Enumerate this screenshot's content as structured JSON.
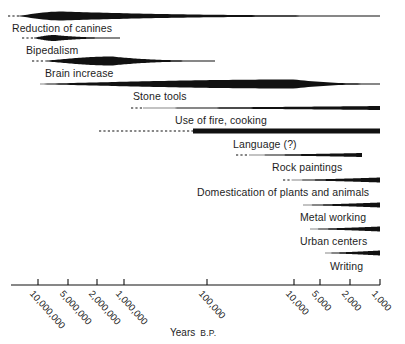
{
  "figure": {
    "axis_title_main": "Years",
    "axis_title_suffix": "B.P.",
    "ink": "#111111"
  },
  "chart_data": {
    "type": "timeline",
    "title": "",
    "xlabel": "Years B.P.",
    "ylabel": "",
    "scale": "logarithmic-reversed",
    "grid": false,
    "legend": null,
    "axis": {
      "line_x_start": 11,
      "line_x_end": 380,
      "line_y": 285,
      "tick_labels": [
        "10,000,000",
        "5,000,000",
        "2,000,000",
        "1,000,000",
        "100,000",
        "10,000",
        "5,000",
        "2,000",
        "1,000"
      ],
      "tick_values": [
        10000000,
        5000000,
        2000000,
        1000000,
        100000,
        10000,
        5000,
        2000,
        1000
      ],
      "tick_x": [
        38,
        68,
        97,
        124,
        207,
        294,
        320,
        350,
        380
      ]
    },
    "categories": [
      "Reduction of canines",
      "Bipedalism",
      "Brain increase",
      "Stone tools",
      "Use of fire, cooking",
      "Language (?)",
      "Rock paintings",
      "Domestication of plants and animals",
      "Metal working",
      "Urban centers",
      "Writing"
    ],
    "bars": [
      {
        "label": "Reduction of canines",
        "shape": "spindle-then-line",
        "dashed_from_x": 8,
        "dashed_to_x": 19,
        "solid_from_x": 19,
        "peak_x": 62,
        "peak_thickness": 9,
        "end_x": 380,
        "end_thickness": 1,
        "y": 16,
        "label_x": 12,
        "label_y": 22
      },
      {
        "label": "Bipedalism",
        "shape": "spindle",
        "dashed_from_x": 22,
        "dashed_to_x": 34,
        "solid_from_x": 34,
        "peak_x": 55,
        "peak_thickness": 6,
        "end_x": 120,
        "end_thickness": 0.8,
        "y": 38,
        "label_x": 26,
        "label_y": 44
      },
      {
        "label": "Brain increase",
        "shape": "spindle",
        "dashed_from_x": 32,
        "dashed_to_x": 45,
        "solid_from_x": 45,
        "peak_x": 112,
        "peak_thickness": 9,
        "end_x": 215,
        "end_thickness": 0.8,
        "y": 61,
        "label_x": 45,
        "label_y": 67
      },
      {
        "label": "Stone tools",
        "shape": "spindle",
        "dashed_from_x": null,
        "dashed_to_x": null,
        "solid_from_x": 40,
        "peak_x": 295,
        "peak_thickness": 9,
        "end_x": 380,
        "end_thickness": 1,
        "y": 84,
        "label_x": 133,
        "label_y": 90
      },
      {
        "label": "Use of fire, cooking",
        "shape": "wedge",
        "dashed_from_x": 131,
        "dashed_to_x": 143,
        "solid_from_x": 143,
        "peak_x": 380,
        "peak_thickness": 4,
        "end_x": 380,
        "end_thickness": 4,
        "y": 108,
        "label_x": 175,
        "label_y": 114
      },
      {
        "label": "Language (?)",
        "shape": "bar",
        "dashed_from_x": 99,
        "dashed_to_x": 193,
        "solid_from_x": 193,
        "peak_x": 380,
        "peak_thickness": 5,
        "end_x": 380,
        "end_thickness": 5,
        "y": 131,
        "label_x": 233,
        "label_y": 138
      },
      {
        "label": "Rock paintings",
        "shape": "wedge",
        "dashed_from_x": 236,
        "dashed_to_x": 249,
        "solid_from_x": 249,
        "peak_x": 362,
        "peak_thickness": 4,
        "end_x": 362,
        "end_thickness": 4,
        "y": 155,
        "label_x": 272,
        "label_y": 161
      },
      {
        "label": "Domestication of plants and animals",
        "shape": "wedge",
        "dashed_from_x": 283,
        "dashed_to_x": 292,
        "solid_from_x": 292,
        "peak_x": 380,
        "peak_thickness": 5,
        "end_x": 380,
        "end_thickness": 5,
        "y": 180,
        "label_x": 197,
        "label_y": 186
      },
      {
        "label": "Metal working",
        "shape": "wedge",
        "dashed_from_x": null,
        "dashed_to_x": null,
        "solid_from_x": 303,
        "peak_x": 380,
        "peak_thickness": 5,
        "end_x": 380,
        "end_thickness": 5,
        "y": 205,
        "label_x": 300,
        "label_y": 211
      },
      {
        "label": "Urban centers",
        "shape": "wedge",
        "dashed_from_x": null,
        "dashed_to_x": null,
        "solid_from_x": 310,
        "peak_x": 380,
        "peak_thickness": 5,
        "end_x": 380,
        "end_thickness": 5,
        "y": 229,
        "label_x": 300,
        "label_y": 235
      },
      {
        "label": "Writing",
        "shape": "wedge",
        "dashed_from_x": null,
        "dashed_to_x": null,
        "solid_from_x": 325,
        "peak_x": 380,
        "peak_thickness": 5,
        "end_x": 380,
        "end_thickness": 5,
        "y": 253,
        "label_x": 330,
        "label_y": 260
      }
    ]
  }
}
